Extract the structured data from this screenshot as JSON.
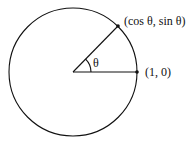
{
  "diagram": {
    "type": "unit-circle",
    "center": {
      "x": 73,
      "y": 72
    },
    "radius": 64,
    "stroke_color": "#111111",
    "angle_label": "θ",
    "points": [
      {
        "id": "p-angle",
        "x": 118,
        "y": 26,
        "label": "(cos θ, sin θ)"
      },
      {
        "id": "p-unit",
        "x": 137,
        "y": 72,
        "label": "(1, 0)"
      }
    ]
  }
}
